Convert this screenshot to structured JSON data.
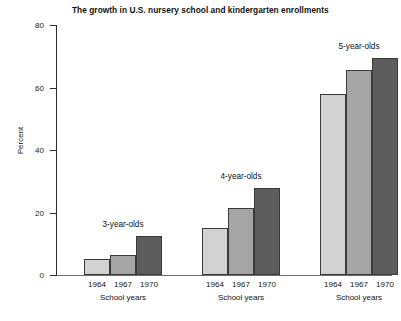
{
  "chart_data": {
    "type": "bar",
    "title": "The growth in U.S. nursery school and kindergarten enrollments",
    "xlabel": "School years",
    "ylabel": "Percent",
    "ylim": [
      0,
      80
    ],
    "yticks": [
      0,
      20,
      40,
      60,
      80
    ],
    "grid": false,
    "legend": "none",
    "categories": [
      "1964",
      "1967",
      "1970"
    ],
    "groups": [
      {
        "name": "3-year-olds",
        "axis_label": "School years",
        "categories": [
          "1964",
          "1967",
          "1970"
        ],
        "values": [
          5,
          6.5,
          12.5
        ],
        "colors": [
          "#d2d2d2",
          "#a5a5a5",
          "#5c5c5c"
        ]
      },
      {
        "name": "4-year-olds",
        "axis_label": "School years",
        "categories": [
          "1964",
          "1967",
          "1970"
        ],
        "values": [
          15,
          21.5,
          28
        ],
        "colors": [
          "#d2d2d2",
          "#a5a5a5",
          "#5c5c5c"
        ]
      },
      {
        "name": "5-year-olds",
        "axis_label": "School years",
        "categories": [
          "1964",
          "1967",
          "1970"
        ],
        "values": [
          58,
          65.5,
          69.5
        ],
        "colors": [
          "#d2d2d2",
          "#a5a5a5",
          "#5c5c5c"
        ]
      }
    ],
    "series": [
      {
        "name": "1964",
        "values": [
          5,
          15,
          58
        ]
      },
      {
        "name": "1967",
        "values": [
          6.5,
          21.5,
          65.5
        ]
      },
      {
        "name": "1970",
        "values": [
          12.5,
          28,
          69.5
        ]
      }
    ]
  },
  "axis": {
    "y_title": "Percent",
    "y_tick_labels": [
      "0",
      "20",
      "40",
      "60",
      "80"
    ]
  },
  "title": "The growth in U.S. nursery school and kindergarten enrollments"
}
